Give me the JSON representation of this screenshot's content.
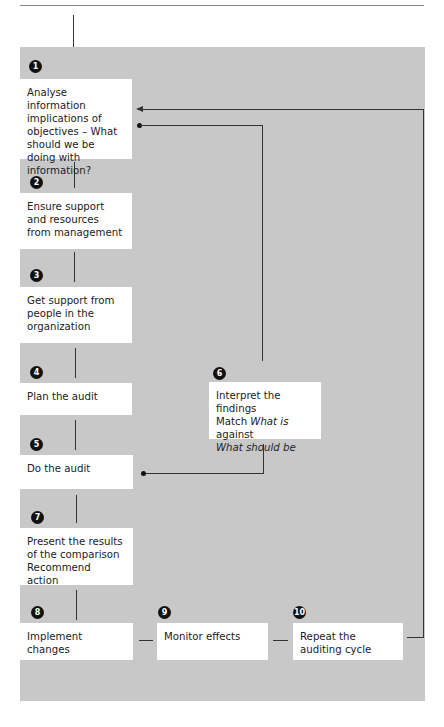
{
  "steps": [
    {
      "n": "1",
      "text": "Analyse information implications of objectives – What should we be doing with information?"
    },
    {
      "n": "2",
      "text": "Ensure support and resources from management"
    },
    {
      "n": "3",
      "text": "Get support from people in the organization"
    },
    {
      "n": "4",
      "text": "Plan the audit"
    },
    {
      "n": "5",
      "text": "Do the audit"
    },
    {
      "n": "6",
      "line1": "Interpret the findings",
      "line2_a": "Match ",
      "line2_b": "What is",
      "line2_c": " against",
      "line3": "What should be"
    },
    {
      "n": "7",
      "text": "Present the results of the comparison Recommend action"
    },
    {
      "n": "8",
      "text": "Implement changes"
    },
    {
      "n": "9",
      "text": "Monitor effects"
    },
    {
      "n": "10",
      "text": "Repeat the auditing cycle"
    }
  ],
  "colors": {
    "panel": "#c8c8c8",
    "box": "#ffffff",
    "line": "#333333",
    "badge": "#111111"
  }
}
